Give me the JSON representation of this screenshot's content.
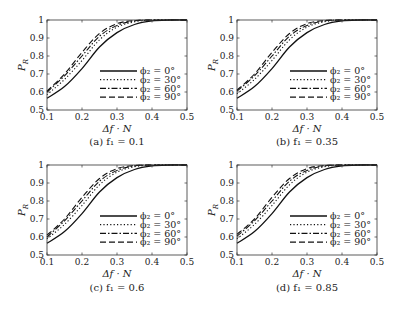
{
  "figure": {
    "background": "#ffffff",
    "line_color": "#111111"
  },
  "legend_entries": [
    {
      "label": "ϕ₂ = 0°",
      "style": "solid"
    },
    {
      "label": "ϕ₂ = 30°",
      "style": "dotted"
    },
    {
      "label": "ϕ₂ = 60°",
      "style": "dashdot"
    },
    {
      "label": "ϕ₂ = 90°",
      "style": "dashed"
    }
  ],
  "chart_data": [
    {
      "type": "line",
      "panel": "a",
      "caption": "(a) f₁ = 0.1",
      "title": "",
      "xlabel": "Δf · N",
      "ylabel": "P_R",
      "xlim": [
        0.1,
        0.5
      ],
      "ylim": [
        0.5,
        1.0
      ],
      "xticks": [
        "0.1",
        "0.2",
        "0.3",
        "0.4",
        "0.5"
      ],
      "yticks": [
        "0.5",
        "0.6",
        "0.7",
        "0.8",
        "0.9",
        "1"
      ],
      "grid": false,
      "legend_position": "lower right",
      "x": [
        0.1,
        0.15,
        0.2,
        0.25,
        0.3,
        0.35,
        0.4,
        0.45,
        0.5
      ],
      "series": [
        {
          "name": "ϕ₂ = 0°",
          "style": "solid",
          "values": [
            0.565,
            0.63,
            0.73,
            0.85,
            0.93,
            0.975,
            0.995,
            1.0,
            1.0
          ]
        },
        {
          "name": "ϕ₂ = 30°",
          "style": "dotted",
          "values": [
            0.585,
            0.67,
            0.775,
            0.89,
            0.96,
            0.99,
            1.0,
            1.0,
            1.0
          ]
        },
        {
          "name": "ϕ₂ = 60°",
          "style": "dashdot",
          "values": [
            0.6,
            0.69,
            0.8,
            0.91,
            0.97,
            0.995,
            1.0,
            1.0,
            1.0
          ]
        },
        {
          "name": "ϕ₂ = 90°",
          "style": "dashed",
          "values": [
            0.605,
            0.7,
            0.82,
            0.925,
            0.98,
            0.997,
            1.0,
            1.0,
            1.0
          ]
        }
      ]
    },
    {
      "type": "line",
      "panel": "b",
      "caption": "(b) f₁ = 0.35",
      "title": "",
      "xlabel": "Δf · N",
      "ylabel": "P_R",
      "xlim": [
        0.1,
        0.5
      ],
      "ylim": [
        0.5,
        1.0
      ],
      "xticks": [
        "0.1",
        "0.2",
        "0.3",
        "0.4",
        "0.5"
      ],
      "yticks": [
        "0.5",
        "0.6",
        "0.7",
        "0.8",
        "0.9",
        "1"
      ],
      "grid": false,
      "legend_position": "lower right",
      "x": [
        0.1,
        0.15,
        0.2,
        0.25,
        0.3,
        0.35,
        0.4,
        0.45,
        0.5
      ],
      "series": [
        {
          "name": "ϕ₂ = 0°",
          "style": "solid",
          "values": [
            0.565,
            0.63,
            0.73,
            0.85,
            0.93,
            0.975,
            0.995,
            1.0,
            1.0
          ]
        },
        {
          "name": "ϕ₂ = 30°",
          "style": "dotted",
          "values": [
            0.59,
            0.67,
            0.775,
            0.89,
            0.96,
            0.99,
            1.0,
            1.0,
            1.0
          ]
        },
        {
          "name": "ϕ₂ = 60°",
          "style": "dashdot",
          "values": [
            0.605,
            0.69,
            0.8,
            0.91,
            0.97,
            0.995,
            1.0,
            1.0,
            1.0
          ]
        },
        {
          "name": "ϕ₂ = 90°",
          "style": "dashed",
          "values": [
            0.61,
            0.7,
            0.82,
            0.925,
            0.98,
            0.997,
            1.0,
            1.0,
            1.0
          ]
        }
      ]
    },
    {
      "type": "line",
      "panel": "c",
      "caption": "(c) f₁ = 0.6",
      "title": "",
      "xlabel": "Δf · N",
      "ylabel": "P_R",
      "xlim": [
        0.1,
        0.5
      ],
      "ylim": [
        0.5,
        1.0
      ],
      "xticks": [
        "0.1",
        "0.2",
        "0.3",
        "0.4",
        "0.5"
      ],
      "yticks": [
        "0.5",
        "0.6",
        "0.7",
        "0.8",
        "0.9",
        "1"
      ],
      "grid": false,
      "legend_position": "lower right",
      "x": [
        0.1,
        0.15,
        0.2,
        0.25,
        0.3,
        0.35,
        0.4,
        0.45,
        0.5
      ],
      "series": [
        {
          "name": "ϕ₂ = 0°",
          "style": "solid",
          "values": [
            0.565,
            0.63,
            0.73,
            0.85,
            0.93,
            0.975,
            0.995,
            1.0,
            1.0
          ]
        },
        {
          "name": "ϕ₂ = 30°",
          "style": "dotted",
          "values": [
            0.59,
            0.67,
            0.775,
            0.89,
            0.96,
            0.99,
            1.0,
            1.0,
            1.0
          ]
        },
        {
          "name": "ϕ₂ = 60°",
          "style": "dashdot",
          "values": [
            0.6,
            0.69,
            0.8,
            0.91,
            0.97,
            0.995,
            1.0,
            1.0,
            1.0
          ]
        },
        {
          "name": "ϕ₂ = 90°",
          "style": "dashed",
          "values": [
            0.61,
            0.7,
            0.82,
            0.925,
            0.98,
            0.997,
            1.0,
            1.0,
            1.0
          ]
        }
      ]
    },
    {
      "type": "line",
      "panel": "d",
      "caption": "(d) f₁ = 0.85",
      "title": "",
      "xlabel": "Δf · N",
      "ylabel": "P_R",
      "xlim": [
        0.1,
        0.5
      ],
      "ylim": [
        0.5,
        1.0
      ],
      "xticks": [
        "0.1",
        "0.2",
        "0.3",
        "0.4",
        "0.5"
      ],
      "yticks": [
        "0.5",
        "0.6",
        "0.7",
        "0.8",
        "0.9",
        "1"
      ],
      "grid": false,
      "legend_position": "lower right",
      "x": [
        0.1,
        0.15,
        0.2,
        0.25,
        0.3,
        0.35,
        0.4,
        0.45,
        0.5
      ],
      "series": [
        {
          "name": "ϕ₂ = 0°",
          "style": "solid",
          "values": [
            0.565,
            0.63,
            0.73,
            0.85,
            0.93,
            0.975,
            0.995,
            1.0,
            1.0
          ]
        },
        {
          "name": "ϕ₂ = 30°",
          "style": "dotted",
          "values": [
            0.59,
            0.67,
            0.775,
            0.89,
            0.96,
            0.99,
            1.0,
            1.0,
            1.0
          ]
        },
        {
          "name": "ϕ₂ = 60°",
          "style": "dashdot",
          "values": [
            0.605,
            0.69,
            0.8,
            0.91,
            0.97,
            0.995,
            1.0,
            1.0,
            1.0
          ]
        },
        {
          "name": "ϕ₂ = 90°",
          "style": "dashed",
          "values": [
            0.615,
            0.7,
            0.82,
            0.925,
            0.98,
            0.997,
            1.0,
            1.0,
            1.0
          ]
        }
      ]
    }
  ]
}
